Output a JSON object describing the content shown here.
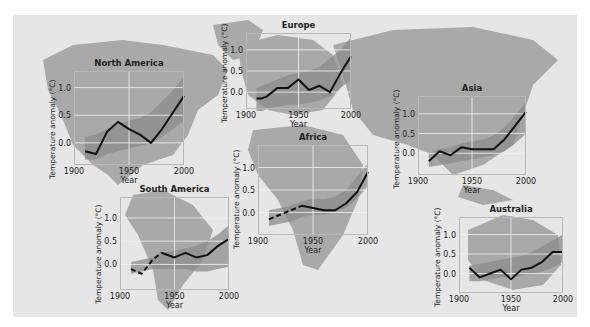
{
  "figure": {
    "background_color": "#e6e6e6",
    "land_color": "#a9a9a9",
    "band_color": "#8c8c8c",
    "line_color": "#111111",
    "grid_color": "#f2f2f2"
  },
  "chart_data": [
    {
      "type": "line",
      "title": "North America",
      "xlabel": "Year",
      "ylabel": "Temperature anomaly (°C)",
      "xticks": [
        "1900",
        "1950",
        "2000"
      ],
      "yticks": [
        "0.0",
        "0.5",
        "1.0"
      ],
      "xlim": [
        1900,
        2000
      ],
      "ylim": [
        -0.4,
        1.3
      ],
      "x": [
        1910,
        1920,
        1930,
        1940,
        1950,
        1960,
        1970,
        1980,
        1990,
        2000
      ],
      "series": [
        {
          "name": "observed",
          "style": "solid",
          "values": [
            -0.15,
            -0.2,
            0.2,
            0.38,
            0.25,
            0.15,
            0.0,
            0.25,
            0.55,
            0.85
          ]
        }
      ],
      "band": {
        "lower": [
          -0.3,
          -0.3,
          -0.2,
          -0.15,
          -0.1,
          -0.05,
          0.0,
          0.1,
          0.25,
          0.4
        ],
        "upper": [
          0.1,
          0.15,
          0.25,
          0.35,
          0.4,
          0.45,
          0.55,
          0.75,
          0.95,
          1.2
        ]
      },
      "layout": {
        "left": 74,
        "top": 71,
        "width": 110,
        "height": 94
      }
    },
    {
      "type": "line",
      "title": "Europe",
      "xlabel": "Year",
      "ylabel": "Temperature anomaly (°C)",
      "xticks": [
        "1900",
        "1950",
        "2000"
      ],
      "yticks": [
        "0.0",
        "0.5",
        "1.0"
      ],
      "xlim": [
        1900,
        2000
      ],
      "ylim": [
        -0.4,
        1.4
      ],
      "x": [
        1910,
        1915,
        1920,
        1930,
        1940,
        1950,
        1960,
        1970,
        1980,
        1990,
        2000
      ],
      "series": [
        {
          "name": "observed",
          "style": "solid",
          "values": [
            -0.15,
            -0.15,
            -0.1,
            0.1,
            0.1,
            0.3,
            0.05,
            0.15,
            0.0,
            0.45,
            0.85
          ]
        }
      ],
      "band": {
        "lower": [
          -0.45,
          -0.45,
          -0.4,
          -0.35,
          -0.3,
          -0.3,
          -0.25,
          -0.2,
          -0.1,
          0.1,
          0.3
        ],
        "upper": [
          0.1,
          0.15,
          0.2,
          0.3,
          0.4,
          0.45,
          0.5,
          0.6,
          0.8,
          1.0,
          1.3
        ]
      },
      "layout": {
        "left": 246,
        "top": 33,
        "width": 105,
        "height": 76
      }
    },
    {
      "type": "line",
      "title": "Asia",
      "xlabel": "Year",
      "ylabel": "Temperature anomaly (°C)",
      "xticks": [
        "1900",
        "1950",
        "2000"
      ],
      "yticks": [
        "0.0",
        "0.5",
        "1.0"
      ],
      "xlim": [
        1900,
        2000
      ],
      "ylim": [
        -0.55,
        1.45
      ],
      "x": [
        1910,
        1920,
        1930,
        1940,
        1950,
        1960,
        1970,
        1980,
        1990,
        2000
      ],
      "series": [
        {
          "name": "observed",
          "style": "solid",
          "values": [
            -0.2,
            0.05,
            -0.05,
            0.15,
            0.1,
            0.1,
            0.1,
            0.35,
            0.7,
            1.05
          ]
        }
      ],
      "band": {
        "lower": [
          -0.35,
          -0.3,
          -0.25,
          -0.2,
          -0.15,
          -0.1,
          -0.05,
          0.05,
          0.25,
          0.5
        ],
        "upper": [
          0.0,
          0.1,
          0.15,
          0.25,
          0.3,
          0.35,
          0.45,
          0.65,
          0.95,
          1.3
        ]
      },
      "layout": {
        "left": 418,
        "top": 96,
        "width": 108,
        "height": 79
      }
    },
    {
      "type": "line",
      "title": "Africa",
      "xlabel": "Year",
      "ylabel": "Temperature anomaly (°C)",
      "xticks": [
        "1900",
        "1950",
        "2000"
      ],
      "yticks": [
        "0.0",
        "0.5",
        "1.0"
      ],
      "xlim": [
        1900,
        2000
      ],
      "ylim": [
        -0.5,
        1.5
      ],
      "x": [
        1910,
        1920,
        1930,
        1940,
        1950,
        1960,
        1970,
        1980,
        1990,
        2000
      ],
      "series": [
        {
          "name": "observed-sparse",
          "style": "dashed",
          "x": [
            1910,
            1920,
            1930,
            1940
          ],
          "values": [
            -0.15,
            -0.05,
            0.05,
            0.15
          ]
        },
        {
          "name": "observed",
          "style": "solid",
          "x": [
            1940,
            1950,
            1960,
            1970,
            1980,
            1990,
            2000
          ],
          "values": [
            0.15,
            0.1,
            0.05,
            0.05,
            0.2,
            0.45,
            0.9
          ]
        }
      ],
      "band": {
        "lower": [
          -0.3,
          -0.25,
          -0.2,
          -0.1,
          -0.05,
          -0.05,
          0.0,
          0.1,
          0.3,
          0.6
        ],
        "upper": [
          0.05,
          0.1,
          0.15,
          0.25,
          0.3,
          0.3,
          0.35,
          0.5,
          0.8,
          1.1
        ]
      },
      "layout": {
        "left": 258,
        "top": 145,
        "width": 110,
        "height": 90
      }
    },
    {
      "type": "line",
      "title": "South America",
      "xlabel": "Year",
      "ylabel": "Temperature anomaly (°C)",
      "xticks": [
        "1900",
        "1950",
        "2000"
      ],
      "yticks": [
        "0.0",
        "0.5",
        "1.0"
      ],
      "xlim": [
        1900,
        2000
      ],
      "ylim": [
        -0.55,
        1.45
      ],
      "x": [
        1910,
        1920,
        1930,
        1940,
        1950,
        1960,
        1970,
        1980,
        1990,
        2000
      ],
      "series": [
        {
          "name": "observed-sparse",
          "style": "dashed",
          "x": [
            1910,
            1915,
            1920,
            1925,
            1930,
            1938
          ],
          "values": [
            -0.1,
            -0.15,
            -0.2,
            -0.05,
            0.1,
            0.25
          ]
        },
        {
          "name": "observed",
          "style": "solid",
          "x": [
            1938,
            1950,
            1960,
            1970,
            1980,
            1990,
            2000
          ],
          "values": [
            0.25,
            0.15,
            0.25,
            0.15,
            0.2,
            0.4,
            0.55
          ]
        }
      ],
      "band": {
        "lower": [
          -0.2,
          -0.15,
          -0.1,
          -0.1,
          -0.1,
          -0.1,
          -0.15,
          -0.15,
          -0.1,
          -0.05
        ],
        "upper": [
          0.05,
          0.1,
          0.15,
          0.25,
          0.3,
          0.35,
          0.4,
          0.5,
          0.65,
          0.85
        ]
      },
      "layout": {
        "left": 120,
        "top": 197,
        "width": 109,
        "height": 93
      }
    },
    {
      "type": "line",
      "title": "Australia",
      "xlabel": "Year",
      "ylabel": "Temperature anomaly (°C)",
      "xticks": [
        "1900",
        "1950",
        "2000"
      ],
      "yticks": [
        "0.0",
        "0.5",
        "1.0"
      ],
      "xlim": [
        1900,
        2000
      ],
      "ylim": [
        -0.5,
        1.45
      ],
      "x": [
        1910,
        1920,
        1930,
        1940,
        1950,
        1960,
        1970,
        1980,
        1990,
        2000
      ],
      "series": [
        {
          "name": "observed",
          "style": "solid",
          "values": [
            0.15,
            -0.1,
            0.0,
            0.1,
            -0.15,
            0.1,
            0.15,
            0.3,
            0.55,
            0.55
          ]
        }
      ],
      "band": {
        "lower": [
          -0.2,
          -0.2,
          -0.15,
          -0.1,
          -0.1,
          -0.05,
          0.0,
          0.05,
          0.15,
          0.3
        ],
        "upper": [
          0.2,
          0.25,
          0.3,
          0.35,
          0.4,
          0.45,
          0.55,
          0.7,
          0.85,
          1.0
        ]
      },
      "layout": {
        "left": 459,
        "top": 217,
        "width": 104,
        "height": 76
      }
    }
  ]
}
